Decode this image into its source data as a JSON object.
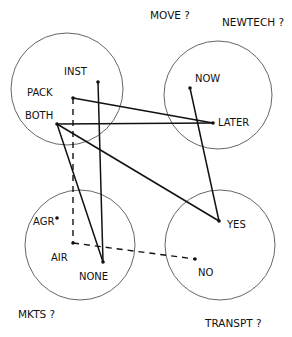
{
  "diagram": {
    "type": "hand-drawn option graph",
    "groups": [
      {
        "id": "move",
        "title": "MOVE ?",
        "title_pos": [
          150,
          19
        ],
        "circle": [
          67,
          89,
          56
        ],
        "nodes": [
          {
            "id": "inst",
            "label": "INST",
            "pos": [
              98,
              82
            ],
            "label_pos": [
              64,
              75
            ]
          },
          {
            "id": "pack",
            "label": "PACK",
            "pos": [
              73,
              98
            ],
            "label_pos": [
              27,
              96
            ]
          },
          {
            "id": "both",
            "label": "BOTH",
            "pos": [
              57,
              124
            ],
            "label_pos": [
              25,
              119
            ]
          }
        ]
      },
      {
        "id": "newtech",
        "title": "NEWTECH ?",
        "title_pos": [
          222,
          26
        ],
        "circle": [
          218,
          95,
          54
        ],
        "nodes": [
          {
            "id": "now",
            "label": "NOW",
            "pos": [
              190,
              88
            ],
            "label_pos": [
              195,
              82
            ]
          },
          {
            "id": "later",
            "label": "LATER",
            "pos": [
              213,
              123
            ],
            "label_pos": [
              218,
              126
            ]
          }
        ]
      },
      {
        "id": "mkts",
        "title": "MKTS ?",
        "title_pos": [
          18,
          318
        ],
        "circle": [
          80,
          245,
          55
        ],
        "nodes": [
          {
            "id": "agr",
            "label": "AGR",
            "pos": [
              57,
              218
            ],
            "label_pos": [
              33,
              225
            ]
          },
          {
            "id": "air",
            "label": "AIR",
            "pos": [
              73,
              243
            ],
            "label_pos": [
              51,
              261
            ]
          },
          {
            "id": "none",
            "label": "NONE",
            "pos": [
              103,
              262
            ],
            "label_pos": [
              79,
              280
            ]
          }
        ]
      },
      {
        "id": "transpt",
        "title": "TRANSPT ?",
        "title_pos": [
          205,
          327
        ],
        "circle": [
          220,
          245,
          55
        ],
        "nodes": [
          {
            "id": "yes",
            "label": "YES",
            "pos": [
              219,
              221
            ],
            "label_pos": [
              227,
              228
            ]
          },
          {
            "id": "no",
            "label": "NO",
            "pos": [
              195,
              259
            ],
            "label_pos": [
              198,
              276
            ]
          }
        ]
      }
    ],
    "edges": [
      {
        "from": "pack",
        "to": "later",
        "style": "solid"
      },
      {
        "from": "both",
        "to": "later",
        "style": "solid"
      },
      {
        "from": "both",
        "to": "yes",
        "style": "solid"
      },
      {
        "from": "both",
        "to": "none",
        "style": "solid"
      },
      {
        "from": "inst",
        "to": "none",
        "style": "solid"
      },
      {
        "from": "now",
        "to": "yes",
        "style": "solid"
      },
      {
        "from": "pack",
        "to": "air",
        "style": "dashed"
      },
      {
        "from": "air",
        "to": "no",
        "style": "dashed"
      }
    ]
  }
}
